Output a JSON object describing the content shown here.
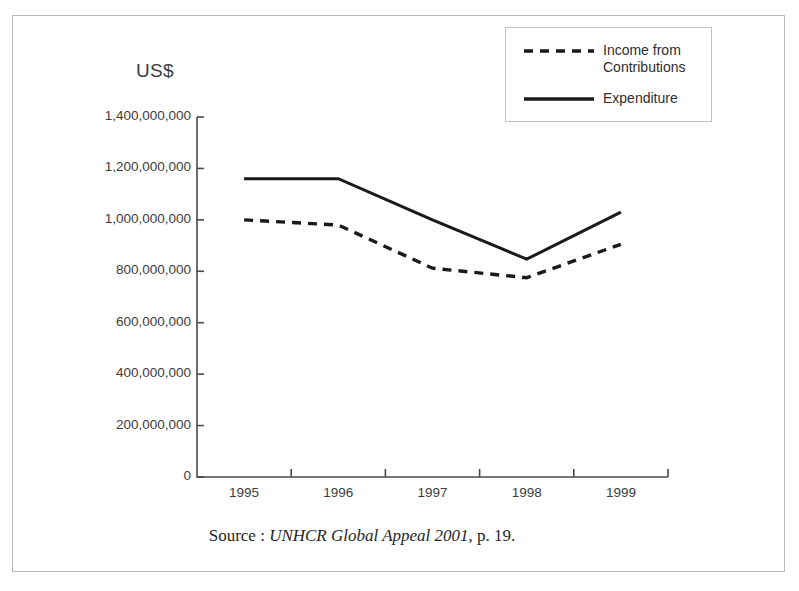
{
  "figure": {
    "unit_label": "US$",
    "source_prefix": "Source : ",
    "source_title": "UNHCR Global Appeal 2001",
    "source_suffix": ", p. 19."
  },
  "legend": {
    "position": "top-right",
    "entries": [
      {
        "label": "Income from\nContributions",
        "style": "dashed",
        "color": "#1a1a1a"
      },
      {
        "label": "Expenditure",
        "style": "solid",
        "color": "#1a1a1a"
      }
    ]
  },
  "chart_data": {
    "type": "line",
    "title": "",
    "subtitle": "",
    "xlabel": "",
    "ylabel": "US$",
    "categories": [
      "1995",
      "1996",
      "1997",
      "1998",
      "1999"
    ],
    "ylim": [
      0,
      1400000000
    ],
    "ytick_values": [
      0,
      200000000,
      400000000,
      600000000,
      800000000,
      1000000000,
      1200000000,
      1400000000
    ],
    "ytick_labels": [
      "0",
      "200,000,000",
      "400,000,000",
      "600,000,000",
      "800,000,000",
      "1,000,000,000",
      "1,200,000,000",
      "1,400,000,000"
    ],
    "grid": false,
    "legend_position": "top-right",
    "series": [
      {
        "name": "Income from Contributions",
        "style": "dashed",
        "color": "#1a1a1a",
        "values": [
          1000000000,
          980000000,
          812000000,
          775000000,
          905000000
        ]
      },
      {
        "name": "Expenditure",
        "style": "solid",
        "color": "#1a1a1a",
        "values": [
          1160000000,
          1160000000,
          1000000000,
          847000000,
          1030000000
        ]
      }
    ]
  }
}
